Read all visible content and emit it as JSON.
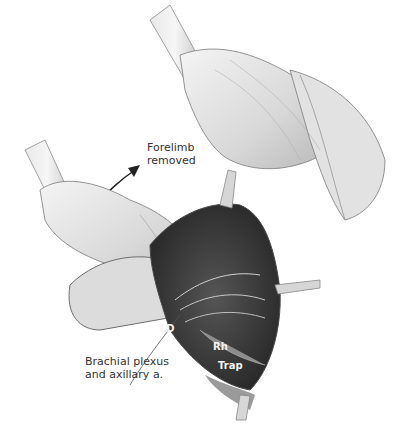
{
  "illustration": {
    "subject": "surgical anatomy illustration",
    "labels": {
      "forelimb_line1": "Forelimb",
      "forelimb_line2": "removed",
      "brachial_line1": "Brachial plexus",
      "brachial_line2": "and axillary a.",
      "ld": "LD",
      "rh": "Rh",
      "trap": "Trap"
    },
    "colors": {
      "background": "#ffffff",
      "muscle_light": "#e6e6e6",
      "muscle_mid": "#bdbdbd",
      "cavity_dark": "#3a3a3a",
      "outline": "#6e6e6e",
      "text": "#333333"
    }
  }
}
